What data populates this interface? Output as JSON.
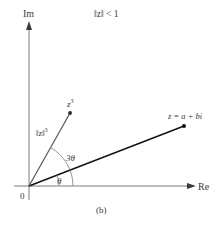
{
  "diagram": {
    "title": "‖z‖ < 1",
    "caption": "(b)",
    "axes": {
      "x_label": "Re",
      "y_label": "Im",
      "origin_label": "0"
    },
    "points": [
      {
        "name": "z",
        "label": "z = a + bi",
        "x": 184,
        "y": 126
      },
      {
        "name": "z3",
        "label_base": "z",
        "label_sup": "3",
        "x": 70,
        "y": 113
      }
    ],
    "segment_labels": {
      "modulus_cubed_base": "‖z‖",
      "modulus_cubed_sup": "3"
    },
    "angle_labels": {
      "theta": "θ",
      "three_theta": "3θ"
    },
    "colors": {
      "axis": "#6b6b6b",
      "vector_z": "#111111",
      "vector_z3": "#555555",
      "arc": "#7a7a7a",
      "text": "#3a3a3a"
    }
  }
}
